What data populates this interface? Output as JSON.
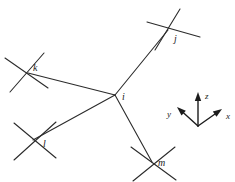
{
  "figure": {
    "background_color": "#ffffff",
    "line_color": "#2b2b2b",
    "label_color": "#1c1c1c",
    "width": 235,
    "height": 182
  },
  "nodes": [
    {
      "id": "i",
      "label": "i",
      "role": "central-atom",
      "x": 115,
      "y": 95,
      "label_x": 122,
      "label_y": 100,
      "marker": "vertex"
    },
    {
      "id": "j",
      "label": "j",
      "role": "neighbour-atom",
      "x": 170,
      "y": 27,
      "label_x": 174,
      "label_y": 42,
      "marker": "cross"
    },
    {
      "id": "k",
      "label": "k",
      "role": "neighbour-atom",
      "x": 26,
      "y": 72,
      "label_x": 33,
      "label_y": 71,
      "marker": "cross"
    },
    {
      "id": "l",
      "label": "l",
      "role": "neighbour-atom",
      "x": 34,
      "y": 140,
      "label_x": 43,
      "label_y": 147,
      "marker": "cross"
    },
    {
      "id": "m",
      "label": "m",
      "role": "neighbour-atom",
      "x": 152,
      "y": 163,
      "label_x": 158,
      "label_y": 166,
      "marker": "cross"
    }
  ],
  "bonds": [
    {
      "id": "bond-i-j",
      "from": "i",
      "to": "j",
      "x1": 115,
      "y1": 95,
      "x2": 168,
      "y2": 30
    },
    {
      "id": "bond-i-k",
      "from": "i",
      "to": "k",
      "x1": 115,
      "y1": 95,
      "x2": 28,
      "y2": 73
    },
    {
      "id": "bond-i-l",
      "from": "i",
      "to": "l",
      "x1": 115,
      "y1": 95,
      "x2": 33,
      "y2": 140
    },
    {
      "id": "bond-i-m",
      "from": "i",
      "to": "m",
      "x1": 115,
      "y1": 95,
      "x2": 152,
      "y2": 162
    }
  ],
  "cross_arms": [
    {
      "node": "j",
      "x1": 147,
      "y1": 22,
      "x2": 200,
      "y2": 37
    },
    {
      "node": "j",
      "x1": 180,
      "y1": 9,
      "x2": 155,
      "y2": 50
    },
    {
      "node": "k",
      "x1": 5,
      "y1": 58,
      "x2": 48,
      "y2": 88
    },
    {
      "node": "k",
      "x1": 44,
      "y1": 53,
      "x2": 10,
      "y2": 92
    },
    {
      "node": "l",
      "x1": 14,
      "y1": 123,
      "x2": 56,
      "y2": 158
    },
    {
      "node": "l",
      "x1": 56,
      "y1": 122,
      "x2": 14,
      "y2": 160
    },
    {
      "node": "m",
      "x1": 131,
      "y1": 147,
      "x2": 176,
      "y2": 180
    },
    {
      "node": "m",
      "x1": 175,
      "y1": 147,
      "x2": 133,
      "y2": 181
    }
  ],
  "axes": {
    "name": "coordinate-triad",
    "origin_x": 198,
    "origin_y": 126,
    "items": [
      {
        "id": "axis-z",
        "label": "z",
        "tip_x": 198,
        "tip_y": 92,
        "label_x": 205,
        "label_y": 99
      },
      {
        "id": "axis-x",
        "label": "x",
        "tip_x": 222,
        "tip_y": 109,
        "label_x": 226,
        "label_y": 119
      },
      {
        "id": "axis-y",
        "label": "y",
        "tip_x": 177,
        "tip_y": 107,
        "label_x": 167,
        "label_y": 117
      }
    ]
  }
}
